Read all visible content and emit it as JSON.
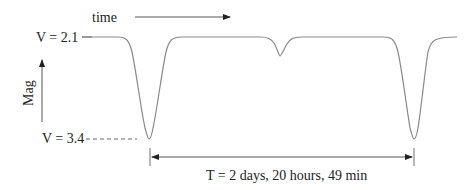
{
  "diagram": {
    "type": "eclipsing-binary-light-curve",
    "time_label": "time",
    "y_axis_label": "Mag",
    "max_label": "V = 2.1",
    "min_label": "V = 3.4",
    "period_label": "T = 2 days, 20 hours, 49 min",
    "curve_color": "#8a8a8a",
    "features": [
      {
        "name": "primary-eclipse-1",
        "x": 149,
        "depth": "V = 3.4"
      },
      {
        "name": "secondary-eclipse",
        "x": 280
      },
      {
        "name": "primary-eclipse-2",
        "x": 414,
        "depth": "V = 3.4"
      }
    ]
  }
}
